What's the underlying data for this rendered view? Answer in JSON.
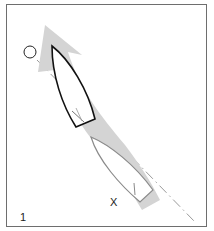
{
  "figure": {
    "panel_number": "1",
    "mark_label": "X",
    "colors": {
      "border": "#6e6e6e",
      "path_arrow": "#d4d4d4",
      "boat_current": "#111111",
      "boat_previous": "#8a8a8a",
      "course_line": "#9a9a9a",
      "buoy": "#222222"
    },
    "elements": [
      {
        "name": "buoy",
        "shape": "circle"
      },
      {
        "name": "curved-path-arrow",
        "shape": "arrow"
      },
      {
        "name": "boat-current-position",
        "style": "black outline"
      },
      {
        "name": "boat-previous-position",
        "style": "grey outline"
      },
      {
        "name": "course-line",
        "style": "dash-dot"
      },
      {
        "name": "mark-x",
        "text": "X"
      }
    ]
  }
}
